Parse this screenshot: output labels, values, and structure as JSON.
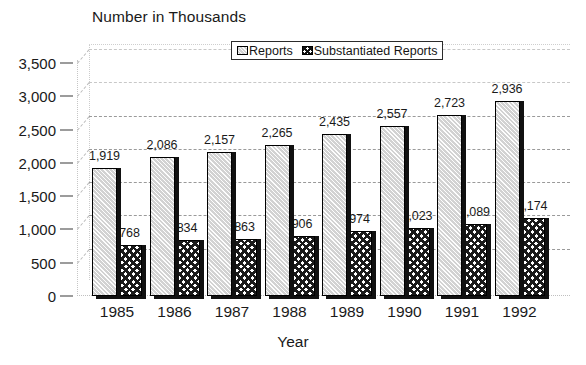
{
  "chart_data": {
    "type": "bar",
    "title": "Number in Thousands",
    "xlabel": "Year",
    "ylabel": "",
    "categories": [
      "1985",
      "1986",
      "1987",
      "1988",
      "1989",
      "1990",
      "1991",
      "1992"
    ],
    "series": [
      {
        "name": "Reports",
        "values": [
          1919,
          2086,
          2157,
          2265,
          2435,
          2557,
          2723,
          2936
        ],
        "labels": [
          "1,919",
          "2,086",
          "2,157",
          "2,265",
          "2,435",
          "2,557",
          "2,723",
          "2,936"
        ],
        "pattern": "diagonal-hatch",
        "color": "#d2d2d2"
      },
      {
        "name": "Substantiated Reports",
        "values": [
          768,
          834,
          863,
          906,
          974,
          1023,
          1089,
          1174
        ],
        "labels": [
          "768",
          "834",
          "863",
          "906",
          "974",
          "1,023",
          "1,089",
          "1,174"
        ],
        "pattern": "checkerboard",
        "color": "#ffffff"
      }
    ],
    "ylim": [
      0,
      3500
    ],
    "ytick_values": [
      3500,
      3000,
      2500,
      2000,
      1500,
      1000,
      500,
      0
    ],
    "ytick_labels": [
      "3,500",
      "3,000",
      "2,500",
      "2,000",
      "1,500",
      "1,000",
      "500",
      "0"
    ],
    "grid": true,
    "grid_axis": "y",
    "legend_position": "top-center",
    "legend_entries": [
      "Reports",
      "Substantiated Reports"
    ],
    "style": "3d-perspective",
    "background_color": "#ffffff",
    "axis_text_color": "#1a1a1a"
  }
}
